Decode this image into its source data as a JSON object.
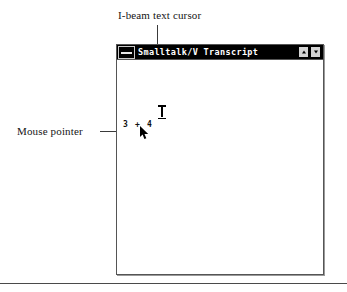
{
  "figure": {
    "background_color": "#ffffff",
    "annotations": [
      {
        "id": "ibeam",
        "label": "I-beam text cursor",
        "points_to": "text-cursor"
      },
      {
        "id": "mouse",
        "label": "Mouse pointer",
        "points_to": "mouse-arrow"
      }
    ]
  },
  "window": {
    "title": "Smalltalk/V Transcript",
    "title_bar_color": "#000000",
    "title_text_color": "#ffffff",
    "system_menu_icon": "system-menu-icon",
    "buttons": [
      {
        "name": "minimize",
        "icon": "triangle-up-icon"
      },
      {
        "name": "maximize",
        "icon": "triangle-down-icon"
      }
    ],
    "client": {
      "background_color": "#ffffff",
      "text": "3 + 4"
    }
  },
  "cursors": {
    "text_cursor": {
      "icon": "i-beam-icon",
      "color": "#000000"
    },
    "mouse_pointer": {
      "icon": "arrow-pointer-icon",
      "color": "#000000"
    }
  }
}
